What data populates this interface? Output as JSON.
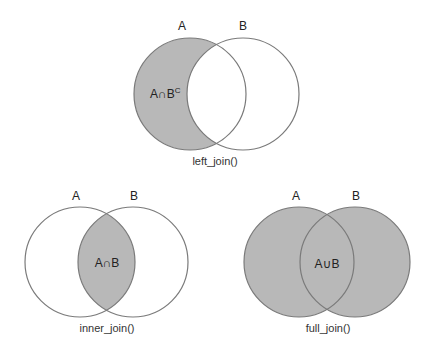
{
  "colors": {
    "fill": "#b8b8b8",
    "stroke": "#7a7a7a",
    "background": "#ffffff",
    "text": "#222222"
  },
  "diagrams": [
    {
      "id": "left_join",
      "caption": "left_join()",
      "label_a": "A",
      "label_b": "B",
      "region_label": "A∩B",
      "region_label_sup": "C",
      "shaded": "A only",
      "circle_a": {
        "cx": 190,
        "cy": 94,
        "r": 56
      },
      "circle_b": {
        "cx": 243,
        "cy": 94,
        "r": 56
      }
    },
    {
      "id": "inner_join",
      "caption": "inner_join()",
      "label_a": "A",
      "label_b": "B",
      "region_label": "A∩B",
      "shaded": "intersection",
      "circle_a": {
        "cx": 80,
        "cy": 262,
        "r": 55
      },
      "circle_b": {
        "cx": 133,
        "cy": 262,
        "r": 55
      }
    },
    {
      "id": "full_join",
      "caption": "full_join()",
      "label_a": "A",
      "label_b": "B",
      "region_label": "A∪B",
      "shaded": "union",
      "circle_a": {
        "cx": 299,
        "cy": 262,
        "r": 55
      },
      "circle_b": {
        "cx": 355,
        "cy": 262,
        "r": 55
      }
    }
  ]
}
